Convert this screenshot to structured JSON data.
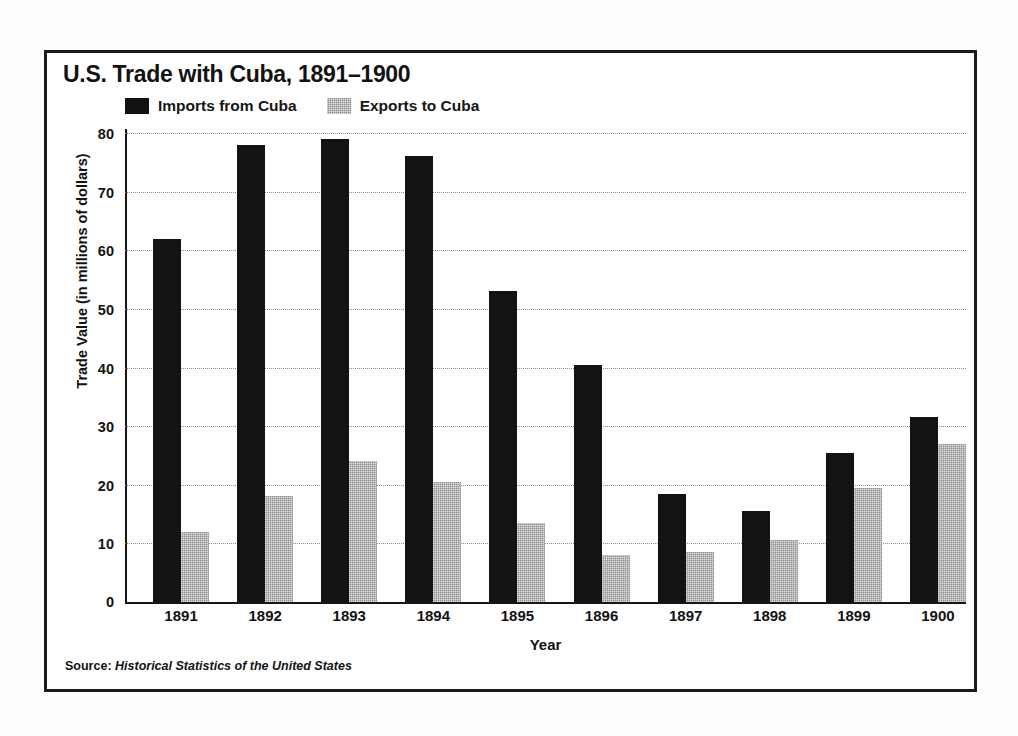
{
  "figure": {
    "title": "U.S. Trade with Cuba, 1891–1900",
    "source_prefix": "Source:",
    "source_title": "Historical Statistics of the United States"
  },
  "legend": {
    "entries": [
      {
        "label": "Imports from Cuba",
        "swatch": "black-square-icon",
        "color": "#131313"
      },
      {
        "label": "Exports to Cuba",
        "swatch": "gray-square-icon",
        "color": "#8f8f8f"
      }
    ]
  },
  "axes": {
    "y_title": "Trade Value (in millions of dollars)",
    "x_title": "Year",
    "y_ticks": [
      "0",
      "10",
      "20",
      "30",
      "40",
      "50",
      "60",
      "70",
      "80"
    ]
  },
  "chart_data": {
    "type": "bar",
    "title": "U.S. Trade with Cuba, 1891–1900",
    "xlabel": "Year",
    "ylabel": "Trade Value (in millions of dollars)",
    "ylim": [
      0,
      80
    ],
    "ytick_step": 10,
    "grid": true,
    "legend_position": "top-left",
    "categories": [
      "1891",
      "1892",
      "1893",
      "1894",
      "1895",
      "1896",
      "1897",
      "1898",
      "1899",
      "1900"
    ],
    "series": [
      {
        "name": "Imports from Cuba",
        "color": "#131313",
        "values": [
          62,
          78,
          79,
          76,
          53,
          40.5,
          18.5,
          15.5,
          25.5,
          31.5
        ]
      },
      {
        "name": "Exports to Cuba",
        "color": "#8f8f8f",
        "values": [
          12,
          18,
          24,
          20.5,
          13.5,
          8,
          8.5,
          10.5,
          19.5,
          27
        ]
      }
    ]
  }
}
